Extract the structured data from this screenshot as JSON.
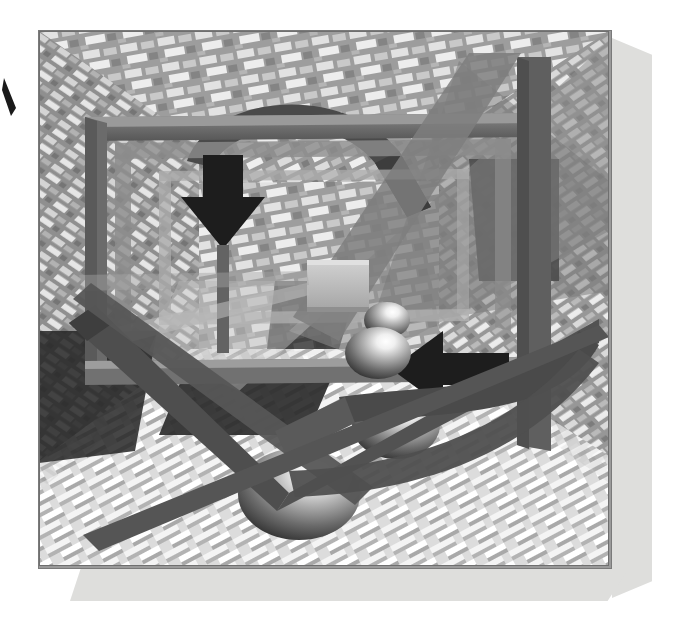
{
  "document": {
    "type": "artwork",
    "title": "Abstract 3D Perspective Composition",
    "medium": "grayscale rendered illustration",
    "background_color": "#ffffff"
  },
  "canvas": {
    "width": 676,
    "height": 639
  },
  "artwork": {
    "frame": {
      "x": 38,
      "y": 30,
      "width": 572,
      "height": 537,
      "border_color": "#7a7a7a"
    },
    "shadow_plates": [
      {
        "name": "right-shadow-plate",
        "x": 612,
        "y": 38,
        "width": 40,
        "height": 560,
        "color": "#dededc"
      },
      {
        "name": "bottom-shadow-plate",
        "x": 70,
        "y": 567,
        "width": 560,
        "height": 34,
        "color": "#dededc"
      }
    ],
    "corner_mark": {
      "name": "left-edge-tick",
      "x": 2,
      "y": 78,
      "width": 16,
      "height": 34,
      "color": "#1a1a1a"
    }
  },
  "palette": {
    "wall_base": "#9d9d9d",
    "wall_brick_light": "#e4e4e4",
    "wall_brick_mid": "#c2c2c2",
    "wall_brick_dark": "#848484",
    "floor_base": "#d6d6d6",
    "floor_step_light": "#f1f1f1",
    "floor_step_shadow": "#b0b0b0",
    "frame_bar": "#6f6f6f",
    "frame_bar_light": "#b9b9b9",
    "frame_bar_dark": "#5a5a5a",
    "arrow_black": "#1d1d1d",
    "ribbon_dark": "#4a4a4a",
    "ribbon_mid": "#6a6a6a",
    "shadow_black": "#2a2a2a",
    "sphere_highlight": "#ffffff",
    "sphere_mid": "#a9a9a9",
    "sphere_dark": "#3d3d3d",
    "cube_face": "#bdbdbd",
    "panel_shadow": "#dededc"
  },
  "elements": {
    "walls": [
      {
        "name": "back-wall",
        "description": "brick textured rear wall"
      },
      {
        "name": "left-wall",
        "description": "brick textured left wall in perspective"
      },
      {
        "name": "right-wall",
        "description": "brick textured right wall in perspective"
      }
    ],
    "floor": {
      "name": "stepped-floor",
      "description": "light stepped block floor receding to vanishing point"
    },
    "frame_structure": {
      "name": "rectangular-frame",
      "description": "thick gray bar rectangle suspended in the room",
      "bars": [
        "top-bar",
        "left-bar",
        "right-bar",
        "bottom-bar"
      ]
    },
    "arrows": [
      {
        "name": "down-arrow",
        "direction": "down",
        "color": "#1d1d1d",
        "cx": 186,
        "cy": 190
      },
      {
        "name": "left-arrow",
        "direction": "left",
        "color": "#1d1d1d",
        "cx": 440,
        "cy": 352
      }
    ],
    "ribbons": [
      {
        "name": "top-arc-ribbon",
        "description": "dark arc sweeping over the top frame bar"
      },
      {
        "name": "lower-right-arc-ribbon",
        "description": "dark arc sweeping across lower right corner"
      },
      {
        "name": "large-v-band",
        "description": "large dark V / chevron band crossing the lower composition"
      },
      {
        "name": "diagonal-band",
        "description": "dark diagonal band from upper right to lower left"
      }
    ],
    "spheres": [
      {
        "name": "sphere-1",
        "order": 1,
        "cx": 386,
        "cy": 319,
        "rx": 23,
        "ry": 18,
        "size": "small"
      },
      {
        "name": "sphere-2",
        "order": 2,
        "cx": 377,
        "cy": 352,
        "rx": 33,
        "ry": 26,
        "size": "medium"
      },
      {
        "name": "sphere-3",
        "order": 3,
        "cx": 395,
        "cy": 424,
        "rx": 44,
        "ry": 34,
        "size": "large"
      },
      {
        "name": "sphere-4",
        "order": 4,
        "cx": 298,
        "cy": 493,
        "rx": 61,
        "ry": 46,
        "size": "largest"
      }
    ],
    "cube": {
      "name": "floating-cube",
      "x": 306,
      "y": 259,
      "width": 62,
      "height": 47
    }
  },
  "labels": {
    "alt_text": "Grayscale 3D abstract illustration of a perspective room with brick walls, a suspended rectangular frame, black arrows, curved ribbons and a receding series of spheres."
  }
}
